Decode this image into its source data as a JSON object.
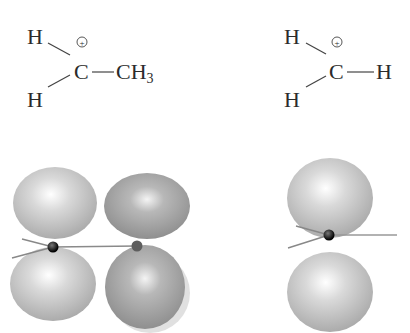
{
  "structures": [
    {
      "name": "ethyl-cation",
      "atoms": {
        "h_top": "H",
        "h_bottom": "H",
        "center": "C",
        "charge": "+",
        "substituent": "CH",
        "subscript": "3"
      },
      "bond_dash": "—"
    },
    {
      "name": "methyl-cation",
      "atoms": {
        "h_top": "H",
        "h_bottom": "H",
        "center": "C",
        "charge": "+",
        "substituent": "H"
      },
      "bond_dash": "—"
    }
  ],
  "orbital_models": [
    {
      "name": "ethyl-cation-orbital-model",
      "lobes": 4,
      "colors": {
        "lobe": "#c8c8c8",
        "lobe_dark": "#9a9a9a",
        "atom": "#111111",
        "atom2": "#6a6a6a"
      }
    },
    {
      "name": "methyl-cation-orbital-model",
      "lobes": 2,
      "colors": {
        "lobe": "#c8c8c8",
        "atom": "#111111"
      }
    }
  ]
}
